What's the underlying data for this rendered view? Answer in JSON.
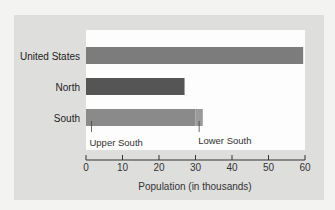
{
  "chart_data": {
    "type": "bar",
    "orientation": "horizontal",
    "title": "",
    "xlabel": "Population (in thousands)",
    "ylabel": "",
    "xlim": [
      0,
      60
    ],
    "xticks": [
      0,
      10,
      20,
      30,
      40,
      50,
      60
    ],
    "grid": false,
    "categories": [
      "United States",
      "North",
      "South"
    ],
    "values": [
      59.5,
      27,
      32
    ],
    "colors": [
      "#7c7c7c",
      "#555555",
      "#8a8a8a"
    ],
    "south_segments": [
      {
        "name": "Upper South",
        "value": 30,
        "color": "#8a8a8a"
      },
      {
        "name": "Lower South",
        "value": 2,
        "color": "#9a9a9a"
      }
    ],
    "annotations": [
      {
        "text": "Upper South",
        "points_to": 1.5
      },
      {
        "text": "Lower South",
        "points_to": 31
      }
    ]
  }
}
